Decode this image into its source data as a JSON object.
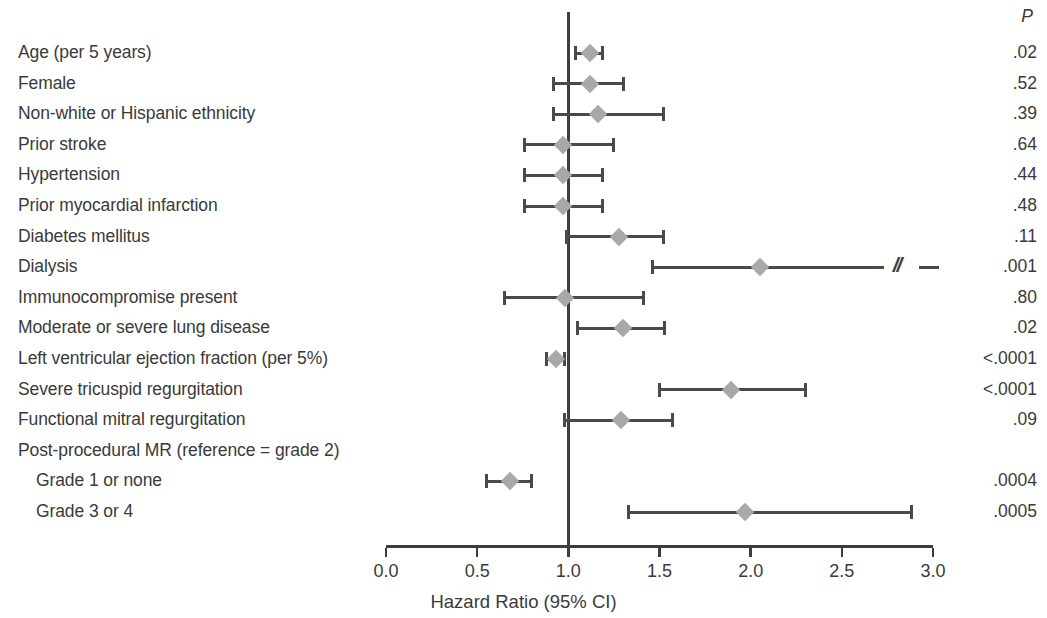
{
  "chart_data": {
    "type": "forest",
    "title": "",
    "xlabel": "Hazard Ratio (95% CI)",
    "ylabel": "",
    "xlim": [
      0.0,
      3.0
    ],
    "xticks": [
      "0.0",
      "0.5",
      "1.0",
      "1.5",
      "2.0",
      "2.5",
      "3.0"
    ],
    "xtick_values": [
      0.0,
      0.5,
      1.0,
      1.5,
      2.0,
      2.5,
      3.0
    ],
    "reference_line": 1.0,
    "grid": false,
    "legend": "none",
    "pvalue_header": "P",
    "effect_measure": "Hazard Ratio",
    "rows": [
      {
        "label": "Age (per 5 years)",
        "hr": 1.12,
        "lo": 1.04,
        "hi": 1.19,
        "p": ".02",
        "indent": false,
        "truncated": false
      },
      {
        "label": "Female",
        "hr": 1.12,
        "lo": 0.92,
        "hi": 1.3,
        "p": ".52",
        "indent": false,
        "truncated": false
      },
      {
        "label": "Non-white or Hispanic ethnicity",
        "hr": 1.16,
        "lo": 0.92,
        "hi": 1.52,
        "p": ".39",
        "indent": false,
        "truncated": false
      },
      {
        "label": "Prior stroke",
        "hr": 0.97,
        "lo": 0.76,
        "hi": 1.25,
        "p": ".64",
        "indent": false,
        "truncated": false
      },
      {
        "label": "Hypertension",
        "hr": 0.97,
        "lo": 0.76,
        "hi": 1.19,
        "p": ".44",
        "indent": false,
        "truncated": false
      },
      {
        "label": "Prior myocardial infarction",
        "hr": 0.97,
        "lo": 0.76,
        "hi": 1.19,
        "p": ".48",
        "indent": false,
        "truncated": false
      },
      {
        "label": "Diabetes mellitus",
        "hr": 1.28,
        "lo": 0.99,
        "hi": 1.52,
        "p": ".11",
        "indent": false,
        "truncated": false
      },
      {
        "label": "Dialysis",
        "hr": 2.05,
        "lo": 1.46,
        "hi": 2.73,
        "p": ".001",
        "indent": false,
        "truncated": true
      },
      {
        "label": "Immunocompromise present",
        "hr": 0.98,
        "lo": 0.65,
        "hi": 1.41,
        "p": ".80",
        "indent": false,
        "truncated": false
      },
      {
        "label": "Moderate or severe lung disease",
        "hr": 1.3,
        "lo": 1.05,
        "hi": 1.53,
        "p": ".02",
        "indent": false,
        "truncated": false
      },
      {
        "label": "Left ventricular ejection fraction (per 5%)",
        "hr": 0.93,
        "lo": 0.88,
        "hi": 0.98,
        "p": "<.0001",
        "indent": false,
        "truncated": false
      },
      {
        "label": "Severe tricuspid regurgitation",
        "hr": 1.89,
        "lo": 1.5,
        "hi": 2.3,
        "p": "<.0001",
        "indent": false,
        "truncated": false
      },
      {
        "label": "Functional mitral regurgitation",
        "hr": 1.29,
        "lo": 0.98,
        "hi": 1.57,
        "p": ".09",
        "indent": false,
        "truncated": false
      },
      {
        "label": "Post-procedural MR (reference = grade 2)",
        "hr": null,
        "lo": null,
        "hi": null,
        "p": "",
        "indent": false,
        "truncated": false
      },
      {
        "label": "Grade 1 or none",
        "hr": 0.68,
        "lo": 0.55,
        "hi": 0.8,
        "p": ".0004",
        "indent": true,
        "truncated": false
      },
      {
        "label": "Grade 3 or 4",
        "hr": 1.97,
        "lo": 1.33,
        "hi": 2.88,
        "p": ".0005",
        "indent": true,
        "truncated": false
      }
    ]
  },
  "colors": {
    "marker": "#a8a8a8",
    "ci_line": "#4a4a4a",
    "reference_line": "#3d3d3d",
    "axis": "#3d3d3d",
    "text": "#3a3a3a",
    "background": "#ffffff"
  }
}
